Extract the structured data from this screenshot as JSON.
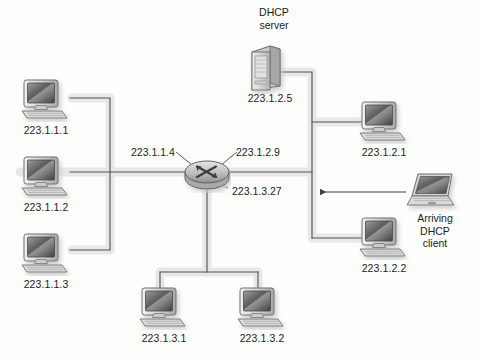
{
  "diagram": {
    "background_color": "#fdfdfc",
    "line_color": "#4a4a4a",
    "text_color": "#1c1c1c",
    "shadow_color": "#d9d9d9"
  },
  "captions": {
    "dhcp_server": "DHCP\nserver",
    "arriving_client": "Arriving\nDHCP\nclient"
  },
  "interfaces": [
    {
      "id": "router-if-left",
      "label": "223.1.1.4",
      "x": 131,
      "y": 146
    },
    {
      "id": "router-if-right",
      "label": "223.1.2.9",
      "x": 236,
      "y": 146
    },
    {
      "id": "router-if-bottom",
      "label": "223.1.3.27",
      "x": 232,
      "y": 185
    }
  ],
  "hosts": [
    {
      "id": "host-223-1-1-1",
      "label": "223.1.1.1",
      "type": "desktop",
      "icon": "desktop-computer-icon",
      "icon_x": 18,
      "icon_y": 78,
      "label_x": 12,
      "label_y": 124
    },
    {
      "id": "host-223-1-1-2",
      "label": "223.1.1.2",
      "type": "desktop",
      "icon": "desktop-computer-icon",
      "icon_x": 18,
      "icon_y": 155,
      "label_x": 12,
      "label_y": 201
    },
    {
      "id": "host-223-1-1-3",
      "label": "223.1.1.3",
      "type": "desktop",
      "icon": "desktop-computer-icon",
      "icon_x": 18,
      "icon_y": 232,
      "label_x": 12,
      "label_y": 278
    },
    {
      "id": "host-223-1-3-1",
      "label": "223.1.3.1",
      "type": "desktop",
      "icon": "desktop-computer-icon",
      "icon_x": 150,
      "icon_y": 278,
      "label_x": 144,
      "label_y": 324
    },
    {
      "id": "host-223-1-3-2",
      "label": "223.1.3.2",
      "type": "desktop",
      "icon": "desktop-computer-icon",
      "icon_x": 234,
      "icon_y": 278,
      "label_x": 228,
      "label_y": 324
    },
    {
      "id": "host-223-1-2-1",
      "label": "223.1.2.1",
      "type": "desktop",
      "icon": "desktop-computer-icon",
      "icon_x": 348,
      "icon_y": 102,
      "label_x": 342,
      "label_y": 148
    },
    {
      "id": "host-223-1-2-2",
      "label": "223.1.2.2",
      "type": "desktop",
      "icon": "desktop-computer-icon",
      "icon_x": 348,
      "icon_y": 208,
      "label_x": 342,
      "label_y": 254
    }
  ],
  "servers": [
    {
      "id": "dhcp-server",
      "label": "223.1.2.5",
      "icon": "server-tower-icon",
      "icon_x": 246,
      "icon_y": 44,
      "label_x": 236,
      "label_y": 94,
      "caption_x": 234,
      "caption_y": 5
    }
  ],
  "clients": [
    {
      "id": "arriving-dhcp-client",
      "icon": "laptop-icon",
      "icon_x": 408,
      "icon_y": 174,
      "caption_x": 398,
      "caption_y": 210
    }
  ],
  "router": {
    "id": "core-router",
    "icon": "router-icon",
    "x": 207,
    "y": 172,
    "rx": 22,
    "ry": 11
  },
  "arrow": {
    "id": "client-join-arrow",
    "from_x": 408,
    "to_x": 317,
    "y": 192
  }
}
